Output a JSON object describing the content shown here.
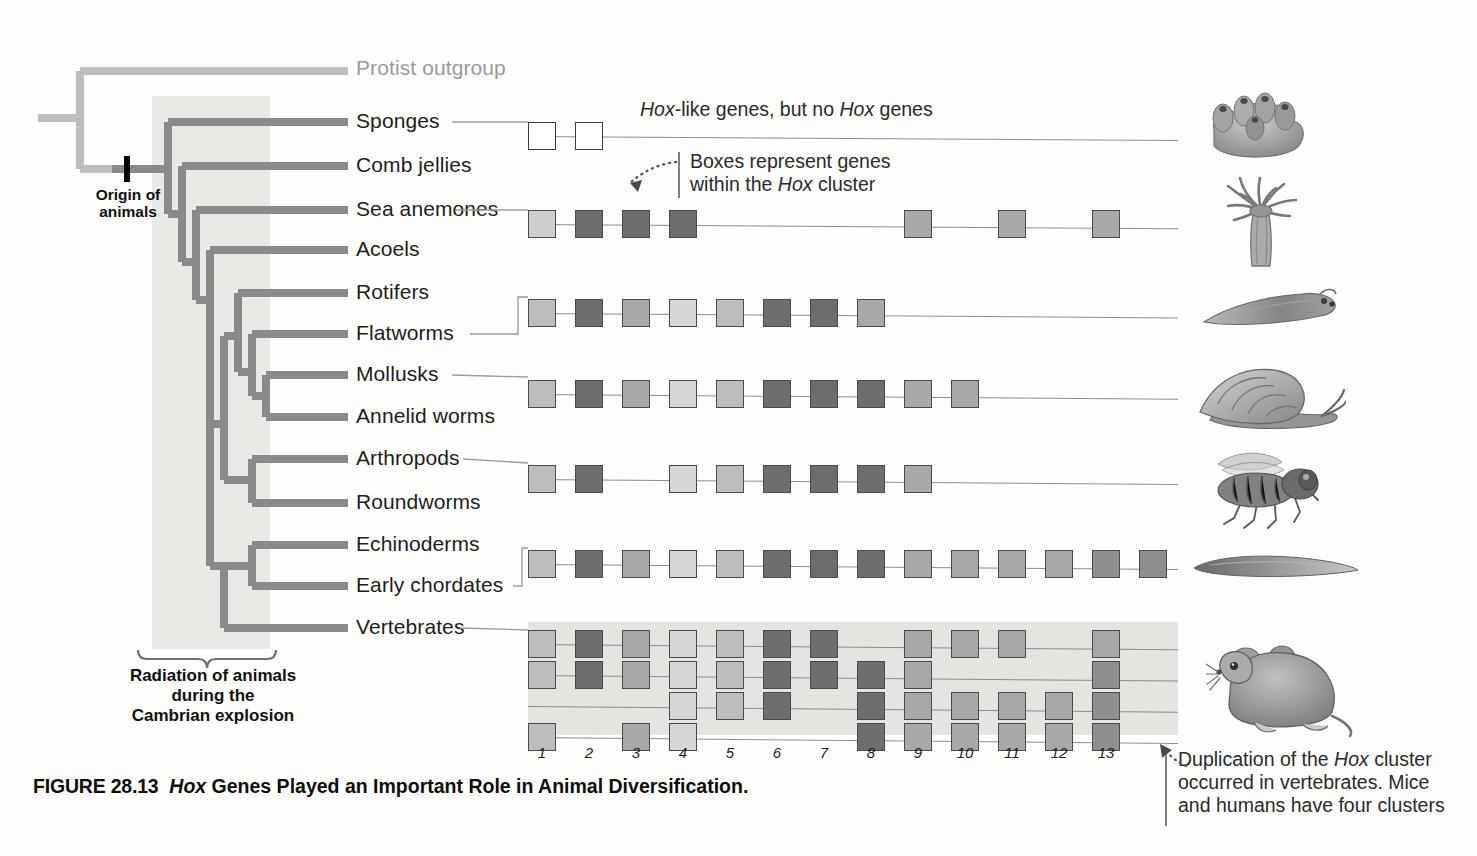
{
  "figure": {
    "caption_number": "FIGURE 28.13",
    "caption_title_pre": "Hox",
    "caption_title_post": " Genes Played an Important Role in Animal Diversification."
  },
  "tree": {
    "origin_label": "Origin of\nanimals",
    "cambrian_label": "Radiation of animals\nduring the\nCambrian explosion",
    "taxa": [
      {
        "name": "Protist outgroup",
        "y": 69,
        "outgroup": true
      },
      {
        "name": "Sponges",
        "y": 122,
        "outgroup": false
      },
      {
        "name": "Comb jellies",
        "y": 166,
        "outgroup": false
      },
      {
        "name": "Sea anemones",
        "y": 210,
        "outgroup": false
      },
      {
        "name": "Acoels",
        "y": 250,
        "outgroup": false
      },
      {
        "name": "Rotifers",
        "y": 293,
        "outgroup": false
      },
      {
        "name": "Flatworms",
        "y": 334,
        "outgroup": false
      },
      {
        "name": "Mollusks",
        "y": 375,
        "outgroup": false
      },
      {
        "name": "Annelid worms",
        "y": 417,
        "outgroup": false
      },
      {
        "name": "Arthropods",
        "y": 459,
        "outgroup": false
      },
      {
        "name": "Roundworms",
        "y": 503,
        "outgroup": false
      },
      {
        "name": "Echinoderms",
        "y": 545,
        "outgroup": false
      },
      {
        "name": "Early chordates",
        "y": 586,
        "outgroup": false
      },
      {
        "name": "Vertebrates",
        "y": 628,
        "outgroup": false
      }
    ]
  },
  "annotations": {
    "hox_like": {
      "pre": "Hox",
      "post": "-like genes, but no ",
      "em2": "Hox",
      "tail": " genes"
    },
    "boxes_represent_line1": "Boxes represent genes",
    "boxes_represent_line2_pre": "within the ",
    "boxes_represent_line2_em": "Hox",
    "boxes_represent_line2_post": " cluster",
    "duplication_line1_pre": "Duplication of the ",
    "duplication_line1_em": "Hox",
    "duplication_line1_post": " cluster",
    "duplication_line2": "occurred in vertebrates. Mice",
    "duplication_line3": "and humans have four clusters"
  },
  "scale": {
    "numbers": [
      "1",
      "2",
      "3",
      "4",
      "5",
      "6",
      "7",
      "8",
      "9",
      "10",
      "11",
      "12",
      "13"
    ]
  },
  "palette": {
    "shade_light": "#cfcfcf",
    "shade_mid": "#a8a8a8",
    "shade_midlight": "#bdbdbd",
    "shade_dark": "#6e6e6e",
    "shade_darker": "#5e5e5e",
    "white": "#ffffff",
    "tree_stroke": "#8a8a8a",
    "outgroup_stroke": "#bdbdbd",
    "cambrian_band": "#e9e9e6",
    "vertebrate_band": "#e4e4e1"
  },
  "chart_data": {
    "type": "diagram",
    "columns": [
      "1",
      "2",
      "3",
      "4",
      "5",
      "6",
      "7",
      "8",
      "9",
      "10",
      "11",
      "12",
      "13"
    ],
    "legend": "Each box represents one gene within the Hox cluster; shade indicates gene identity/paralog group.",
    "rows": [
      {
        "taxon": "Sponges",
        "y": 122,
        "note": "Hox-like genes, but no Hox genes",
        "boxes": [
          {
            "col": 1,
            "shade": "#ffffff"
          },
          {
            "col": 2,
            "shade": "#ffffff"
          }
        ]
      },
      {
        "taxon": "Sea anemones",
        "y": 210,
        "note": "",
        "boxes": [
          {
            "col": 1,
            "shade": "#cfcfcf"
          },
          {
            "col": 2,
            "shade": "#6e6e6e"
          },
          {
            "col": 3,
            "shade": "#6e6e6e"
          },
          {
            "col": 4,
            "shade": "#6e6e6e"
          },
          {
            "col": 9,
            "shade": "#a8a8a8"
          },
          {
            "col": 11,
            "shade": "#a8a8a8"
          },
          {
            "col": 13,
            "shade": "#a8a8a8"
          }
        ]
      },
      {
        "taxon": "Rotifers / Flatworms",
        "y": 299,
        "note": "",
        "boxes": [
          {
            "col": 1,
            "shade": "#bdbdbd"
          },
          {
            "col": 2,
            "shade": "#6e6e6e"
          },
          {
            "col": 3,
            "shade": "#a8a8a8"
          },
          {
            "col": 4,
            "shade": "#d6d6d6"
          },
          {
            "col": 5,
            "shade": "#bdbdbd"
          },
          {
            "col": 6,
            "shade": "#6e6e6e"
          },
          {
            "col": 7,
            "shade": "#6e6e6e"
          },
          {
            "col": 8,
            "shade": "#a8a8a8"
          }
        ]
      },
      {
        "taxon": "Mollusks / Annelid worms",
        "y": 380,
        "note": "",
        "boxes": [
          {
            "col": 1,
            "shade": "#bdbdbd"
          },
          {
            "col": 2,
            "shade": "#6e6e6e"
          },
          {
            "col": 3,
            "shade": "#a8a8a8"
          },
          {
            "col": 4,
            "shade": "#d6d6d6"
          },
          {
            "col": 5,
            "shade": "#bdbdbd"
          },
          {
            "col": 6,
            "shade": "#6e6e6e"
          },
          {
            "col": 7,
            "shade": "#6e6e6e"
          },
          {
            "col": 8,
            "shade": "#6e6e6e"
          },
          {
            "col": 9,
            "shade": "#a8a8a8"
          },
          {
            "col": 10,
            "shade": "#a8a8a8"
          }
        ]
      },
      {
        "taxon": "Arthropods / Roundworms",
        "y": 465,
        "note": "",
        "boxes": [
          {
            "col": 1,
            "shade": "#bdbdbd"
          },
          {
            "col": 2,
            "shade": "#6e6e6e"
          },
          {
            "col": 4,
            "shade": "#d6d6d6"
          },
          {
            "col": 5,
            "shade": "#bdbdbd"
          },
          {
            "col": 6,
            "shade": "#6e6e6e"
          },
          {
            "col": 7,
            "shade": "#6e6e6e"
          },
          {
            "col": 8,
            "shade": "#6e6e6e"
          },
          {
            "col": 9,
            "shade": "#a8a8a8"
          }
        ]
      },
      {
        "taxon": "Echinoderms / Early chordates",
        "y": 550,
        "note": "",
        "boxes": [
          {
            "col": 1,
            "shade": "#bdbdbd"
          },
          {
            "col": 2,
            "shade": "#6e6e6e"
          },
          {
            "col": 3,
            "shade": "#a8a8a8"
          },
          {
            "col": 4,
            "shade": "#d6d6d6"
          },
          {
            "col": 5,
            "shade": "#bdbdbd"
          },
          {
            "col": 6,
            "shade": "#6e6e6e"
          },
          {
            "col": 7,
            "shade": "#6e6e6e"
          },
          {
            "col": 8,
            "shade": "#6e6e6e"
          },
          {
            "col": 9,
            "shade": "#a8a8a8"
          },
          {
            "col": 10,
            "shade": "#a8a8a8"
          },
          {
            "col": 11,
            "shade": "#a8a8a8"
          },
          {
            "col": 12,
            "shade": "#a8a8a8"
          },
          {
            "col": 13,
            "shade": "#8f8f8f"
          },
          {
            "col": 14,
            "shade": "#8f8f8f"
          }
        ]
      },
      {
        "taxon": "Vertebrates cluster A",
        "y": 630,
        "note": "",
        "boxes": [
          {
            "col": 1,
            "shade": "#bdbdbd"
          },
          {
            "col": 2,
            "shade": "#6e6e6e"
          },
          {
            "col": 3,
            "shade": "#a8a8a8"
          },
          {
            "col": 4,
            "shade": "#d6d6d6"
          },
          {
            "col": 5,
            "shade": "#bdbdbd"
          },
          {
            "col": 6,
            "shade": "#6e6e6e"
          },
          {
            "col": 7,
            "shade": "#6e6e6e"
          },
          {
            "col": 9,
            "shade": "#a8a8a8"
          },
          {
            "col": 10,
            "shade": "#a8a8a8"
          },
          {
            "col": 11,
            "shade": "#a8a8a8"
          },
          {
            "col": 13,
            "shade": "#a8a8a8"
          }
        ]
      },
      {
        "taxon": "Vertebrates cluster B",
        "y": 661,
        "note": "",
        "boxes": [
          {
            "col": 1,
            "shade": "#bdbdbd"
          },
          {
            "col": 2,
            "shade": "#6e6e6e"
          },
          {
            "col": 3,
            "shade": "#a8a8a8"
          },
          {
            "col": 4,
            "shade": "#d6d6d6"
          },
          {
            "col": 5,
            "shade": "#bdbdbd"
          },
          {
            "col": 6,
            "shade": "#6e6e6e"
          },
          {
            "col": 7,
            "shade": "#6e6e6e"
          },
          {
            "col": 8,
            "shade": "#6e6e6e"
          },
          {
            "col": 9,
            "shade": "#a8a8a8"
          },
          {
            "col": 13,
            "shade": "#8f8f8f"
          }
        ]
      },
      {
        "taxon": "Vertebrates cluster C",
        "y": 692,
        "note": "",
        "boxes": [
          {
            "col": 4,
            "shade": "#d6d6d6"
          },
          {
            "col": 5,
            "shade": "#bdbdbd"
          },
          {
            "col": 6,
            "shade": "#6e6e6e"
          },
          {
            "col": 8,
            "shade": "#6e6e6e"
          },
          {
            "col": 9,
            "shade": "#a8a8a8"
          },
          {
            "col": 10,
            "shade": "#a8a8a8"
          },
          {
            "col": 11,
            "shade": "#a8a8a8"
          },
          {
            "col": 12,
            "shade": "#a8a8a8"
          },
          {
            "col": 13,
            "shade": "#8f8f8f"
          }
        ]
      },
      {
        "taxon": "Vertebrates cluster D",
        "y": 723,
        "note": "",
        "boxes": [
          {
            "col": 1,
            "shade": "#bdbdbd"
          },
          {
            "col": 3,
            "shade": "#a8a8a8"
          },
          {
            "col": 4,
            "shade": "#d6d6d6"
          },
          {
            "col": 8,
            "shade": "#6e6e6e"
          },
          {
            "col": 9,
            "shade": "#a8a8a8"
          },
          {
            "col": 10,
            "shade": "#a8a8a8"
          },
          {
            "col": 11,
            "shade": "#a8a8a8"
          },
          {
            "col": 12,
            "shade": "#a8a8a8"
          },
          {
            "col": 13,
            "shade": "#8f8f8f"
          }
        ]
      }
    ]
  },
  "animals": [
    {
      "name": "sponge",
      "label": "Sponges"
    },
    {
      "name": "sea-anemone",
      "label": "Sea anemones"
    },
    {
      "name": "flatworm",
      "label": "Flatworms"
    },
    {
      "name": "snail",
      "label": "Mollusks"
    },
    {
      "name": "fly",
      "label": "Arthropods"
    },
    {
      "name": "lancelet",
      "label": "Early chordates"
    },
    {
      "name": "mouse",
      "label": "Vertebrates"
    }
  ]
}
